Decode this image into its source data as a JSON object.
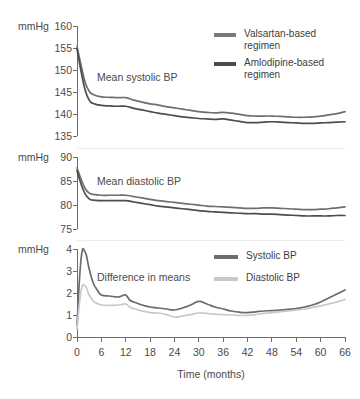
{
  "chart_data": [
    {
      "type": "line",
      "panel": "systolic",
      "title": "Mean systolic BP",
      "xlabel": "",
      "ylabel": "mmHg",
      "xlim": [
        0,
        66
      ],
      "ylim": [
        133,
        160
      ],
      "yticks": [
        135,
        140,
        145,
        150,
        155,
        160
      ],
      "xticks": [
        0,
        6,
        12,
        18,
        24,
        30,
        36,
        42,
        48,
        54,
        60,
        66
      ],
      "grid": false,
      "x": [
        0,
        1,
        2,
        3,
        4,
        6,
        8,
        10,
        12,
        14,
        16,
        18,
        20,
        22,
        24,
        26,
        28,
        30,
        32,
        34,
        36,
        38,
        40,
        42,
        44,
        46,
        48,
        50,
        52,
        54,
        56,
        58,
        60,
        62,
        64,
        66
      ],
      "series": [
        {
          "name": "Valsartan-based regimen",
          "color": "#6f6f6f",
          "values": [
            155.0,
            150.4,
            146.2,
            144.0,
            143.2,
            142.6,
            142.5,
            142.4,
            142.4,
            141.8,
            141.3,
            140.9,
            140.6,
            140.2,
            139.9,
            139.6,
            139.3,
            139.0,
            138.8,
            138.7,
            138.8,
            138.6,
            138.3,
            138.0,
            137.9,
            137.9,
            137.9,
            137.8,
            137.7,
            137.6,
            137.6,
            137.7,
            137.9,
            138.2,
            138.5,
            139.0
          ]
        },
        {
          "name": "Amlodipine-based regimen",
          "color": "#4d4d4d",
          "values": [
            154.4,
            148.9,
            144.3,
            141.8,
            141.0,
            140.5,
            140.4,
            140.3,
            140.3,
            139.8,
            139.4,
            139.0,
            138.6,
            138.3,
            138.0,
            137.7,
            137.5,
            137.3,
            137.2,
            137.1,
            137.2,
            136.9,
            136.6,
            136.3,
            136.3,
            136.4,
            136.5,
            136.4,
            136.3,
            136.2,
            136.1,
            136.1,
            136.2,
            136.3,
            136.4,
            136.5
          ]
        }
      ]
    },
    {
      "type": "line",
      "panel": "diastolic",
      "title": "Mean diastolic BP",
      "xlabel": "",
      "ylabel": "mmHg",
      "xlim": [
        0,
        66
      ],
      "ylim": [
        74,
        90
      ],
      "yticks": [
        75,
        80,
        85,
        90
      ],
      "xticks": [
        0,
        6,
        12,
        18,
        24,
        30,
        36,
        42,
        48,
        54,
        60,
        66
      ],
      "grid": false,
      "x": [
        0,
        1,
        2,
        3,
        4,
        6,
        8,
        10,
        12,
        14,
        16,
        18,
        20,
        22,
        24,
        26,
        28,
        30,
        32,
        34,
        36,
        38,
        40,
        42,
        44,
        46,
        48,
        50,
        52,
        54,
        56,
        58,
        60,
        62,
        64,
        66
      ],
      "series": [
        {
          "name": "Valsartan-based regimen",
          "color": "#6f6f6f",
          "values": [
            87.6,
            85.1,
            83.0,
            82.0,
            81.7,
            81.5,
            81.5,
            81.5,
            81.5,
            81.2,
            80.9,
            80.6,
            80.3,
            80.1,
            79.9,
            79.7,
            79.5,
            79.3,
            79.1,
            79.0,
            78.9,
            78.8,
            78.7,
            78.6,
            78.6,
            78.7,
            78.7,
            78.6,
            78.5,
            78.4,
            78.3,
            78.3,
            78.4,
            78.5,
            78.7,
            78.9
          ]
        },
        {
          "name": "Amlodipine-based regimen",
          "color": "#4d4d4d",
          "values": [
            87.0,
            84.0,
            81.8,
            80.7,
            80.4,
            80.3,
            80.3,
            80.3,
            80.3,
            80.0,
            79.7,
            79.4,
            79.1,
            78.9,
            78.7,
            78.5,
            78.3,
            78.1,
            77.9,
            77.8,
            77.7,
            77.6,
            77.5,
            77.4,
            77.4,
            77.3,
            77.3,
            77.2,
            77.1,
            77.0,
            76.9,
            76.9,
            76.9,
            76.9,
            77.0,
            77.0
          ]
        }
      ]
    },
    {
      "type": "line",
      "panel": "difference",
      "title": "Difference in means",
      "xlabel": "Time (months)",
      "ylabel": "mmHg",
      "xlim": [
        0,
        66
      ],
      "ylim": [
        0,
        4.4
      ],
      "yticks": [
        0,
        1,
        2,
        3,
        4
      ],
      "xticks": [
        0,
        6,
        12,
        18,
        24,
        30,
        36,
        42,
        48,
        54,
        60,
        66
      ],
      "grid": false,
      "x": [
        0,
        1,
        2,
        3,
        4,
        5,
        6,
        8,
        10,
        11,
        12,
        13,
        14,
        16,
        18,
        20,
        22,
        24,
        26,
        28,
        30,
        32,
        34,
        36,
        38,
        40,
        42,
        44,
        46,
        48,
        50,
        52,
        54,
        56,
        58,
        60,
        62,
        64,
        66
      ],
      "series": [
        {
          "name": "Systolic BP",
          "color": "#6b6b6b",
          "values": [
            0.6,
            3.9,
            4.25,
            3.4,
            2.7,
            2.35,
            2.1,
            2.05,
            2.0,
            2.05,
            2.1,
            1.85,
            1.75,
            1.6,
            1.5,
            1.45,
            1.4,
            1.35,
            1.45,
            1.6,
            1.78,
            1.65,
            1.5,
            1.4,
            1.3,
            1.24,
            1.22,
            1.26,
            1.3,
            1.32,
            1.35,
            1.38,
            1.42,
            1.5,
            1.6,
            1.75,
            1.95,
            2.15,
            2.35
          ]
        },
        {
          "name": "Diastolic BP",
          "color": "#c9c9c9",
          "values": [
            0.4,
            2.3,
            2.55,
            2.1,
            1.8,
            1.68,
            1.6,
            1.58,
            1.6,
            1.62,
            1.65,
            1.5,
            1.42,
            1.3,
            1.22,
            1.2,
            1.12,
            1.0,
            1.05,
            1.12,
            1.2,
            1.18,
            1.14,
            1.12,
            1.1,
            1.08,
            1.08,
            1.12,
            1.18,
            1.22,
            1.26,
            1.3,
            1.35,
            1.4,
            1.48,
            1.56,
            1.65,
            1.75,
            1.88
          ]
        }
      ]
    }
  ],
  "axes": {
    "unit_label": "mmHg",
    "x_axis_title": "Time (months)",
    "systolic_yticks": [
      "135",
      "140",
      "145",
      "150",
      "155",
      "160"
    ],
    "diastolic_yticks": [
      "75",
      "80",
      "85",
      "90"
    ],
    "difference_yticks": [
      "0",
      "1",
      "2",
      "3",
      "4"
    ],
    "xticks": [
      "0",
      "6",
      "12",
      "18",
      "24",
      "30",
      "36",
      "42",
      "48",
      "54",
      "60",
      "66"
    ]
  },
  "annotations": {
    "systolic": "Mean systolic BP",
    "diastolic": "Mean diastolic BP",
    "difference": "Difference in means"
  },
  "legends": {
    "top": {
      "items": [
        {
          "label_line1": "Valsartan-based",
          "label_line2": "regimen",
          "color": "#7a7a7a"
        },
        {
          "label_line1": "Amlodipine-based",
          "label_line2": "regimen",
          "color": "#4d4d4d"
        }
      ]
    },
    "bottom": {
      "items": [
        {
          "label": "Systolic BP",
          "color": "#6b6b6b"
        },
        {
          "label": "Diastolic BP",
          "color": "#c9c9c9"
        }
      ]
    }
  }
}
